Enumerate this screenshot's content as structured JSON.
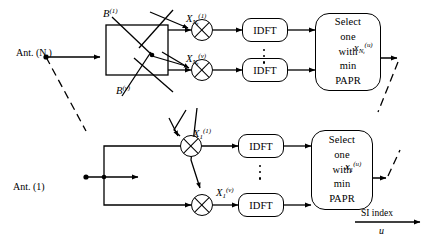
{
  "figure": {
    "stroke_color": "#000000",
    "background_color": "#ffffff",
    "line_style_solid": "solid",
    "line_style_dashed": "dashed"
  },
  "antennas": [
    {
      "id": "ant-nt",
      "label": "Ant. (N",
      "label_sub": "t",
      "label_tail": ")"
    },
    {
      "id": "ant-1",
      "label": "Ant. (1)"
    }
  ],
  "branches": {
    "upper": {
      "phase_label_1": {
        "base": "B",
        "sup": "(1)"
      },
      "phase_label_v": {
        "base": "B",
        "sup": "(v)"
      },
      "signal_1": {
        "base": "X",
        "sub": "N",
        "sub2": "t",
        "sup": "(1)"
      },
      "signal_v": {
        "base": "X",
        "sub": "N",
        "sub2": "t",
        "sup": "(v)"
      },
      "idft_label": "IDFT",
      "select_lines": [
        "Select",
        "one",
        "with",
        "min",
        "PAPR"
      ],
      "output": {
        "base": "x",
        "sub": "N",
        "sub2": "t",
        "sup": "(u)"
      }
    },
    "lower": {
      "signal_1": {
        "base": "X",
        "sub": "1",
        "sup": "(1)"
      },
      "signal_v": {
        "base": "X",
        "sub": "1",
        "sup": "(v)"
      },
      "idft_label": "IDFT",
      "select_lines": [
        "Select",
        "one",
        "with",
        "min",
        "PAPR"
      ],
      "output": {
        "base": "x",
        "sub": "1",
        "sup": "(u)"
      }
    }
  },
  "si_index": {
    "label": "SI index",
    "variable": "u"
  },
  "ellipsis_glyph": "vertical-dots"
}
